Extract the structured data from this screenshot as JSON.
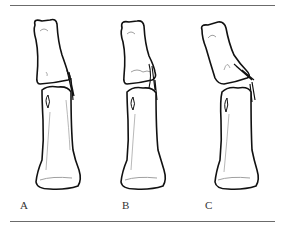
{
  "figure": {
    "panels": [
      {
        "label": "A",
        "description": "Normal joint alignment"
      },
      {
        "label": "B",
        "description": "Joint with small ligament avulsion"
      },
      {
        "label": "C",
        "description": "Joint with angulated distal bone and ligament rupture"
      }
    ]
  },
  "colors": {
    "outline": "#111111",
    "detail": "#8a8a8a",
    "rule": "#6b6b6b",
    "background": "#ffffff"
  }
}
